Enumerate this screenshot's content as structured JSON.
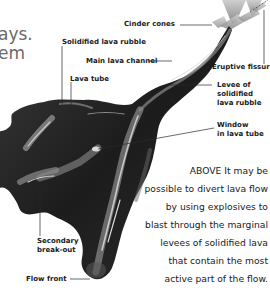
{
  "intro_fragment": {
    "line1": "ays.",
    "line2": "em"
  },
  "labels": {
    "cinder_cones": "Cinder cones",
    "solidified_lava_rubble": "Solidified lava rubble",
    "main_lava_channel": "Main lava channel",
    "lava_tube": "Lava tube",
    "eruptive_fissure": "Eruptive fissure",
    "levee": [
      "Levee of",
      "solidified",
      "lava rubble"
    ],
    "window": [
      "Window",
      "in lava tube"
    ],
    "secondary_breakout": [
      "Secondary",
      "break-out"
    ],
    "flow_front": "Flow front"
  },
  "caption": {
    "lead": "ABOVE",
    "lines": [
      "ABOVE It may be",
      "possible to divert lava flow",
      "by using explosives to",
      "blast through the marginal",
      "levees of solidified lava",
      "that contain the most",
      "active part of the flow."
    ]
  },
  "colors": {
    "lava_dark": "#1e1e1e",
    "lava_mid": "#5a5a5a",
    "lava_light": "#c8c8c8",
    "text": "#1a1a1a",
    "intro_text": "#6a6a6a"
  }
}
